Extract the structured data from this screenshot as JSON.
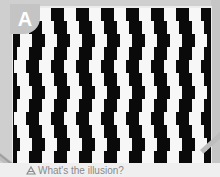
{
  "figure": {
    "label": "A",
    "caption": "What's the illusion?",
    "caption_icon": "pencil-icon",
    "illusion_type": "café wall",
    "colors": {
      "dark_tile": "#0a0a0a",
      "light_tile": "#f7f7f7",
      "badge": "#c4c4c4",
      "background": "#cfcfcf",
      "caption_text": "#8a8a8a"
    },
    "rows": [
      {
        "offset": 0
      },
      {
        "offset": 3
      },
      {
        "offset": 6
      },
      {
        "offset": 3
      },
      {
        "offset": 0
      },
      {
        "offset": 3
      },
      {
        "offset": 6
      },
      {
        "offset": 3
      },
      {
        "offset": 0
      },
      {
        "offset": 3
      },
      {
        "offset": 6
      },
      {
        "offset": 3
      }
    ]
  }
}
